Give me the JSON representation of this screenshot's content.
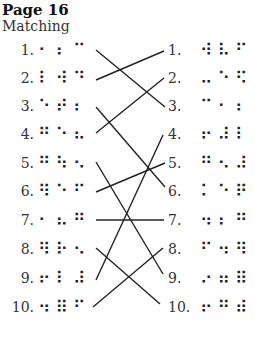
{
  "page": {
    "title": "Page 16",
    "subtitle": "Matching"
  },
  "left_column": [
    {
      "num": "1.",
      "braille": "⠂⠆⠉"
    },
    {
      "num": "2.",
      "braille": "⠇⠺⠙"
    },
    {
      "num": "3.",
      "braille": "⠑⠞⠆"
    },
    {
      "num": "4.",
      "braille": "⠛⠑⠦"
    },
    {
      "num": "5.",
      "braille": "⠛⠳⠢"
    },
    {
      "num": "6.",
      "braille": "⠻⠑⠋"
    },
    {
      "num": "7.",
      "braille": "⠂⠦⠛"
    },
    {
      "num": "8.",
      "braille": "⠻⠗⠢"
    },
    {
      "num": "9.",
      "braille": "⠖⠇⠼"
    },
    {
      "num": "10.",
      "braille": "⠲⠿⠋"
    }
  ],
  "right_column": [
    {
      "num": "1.",
      "braille": "⠺⠧⠋"
    },
    {
      "num": "2.",
      "braille": "⠤⠑⠫"
    },
    {
      "num": "3.",
      "braille": "⠉⠂⠆"
    },
    {
      "num": "4.",
      "braille": "⠖⠼⠇"
    },
    {
      "num": "5.",
      "braille": "⠛⠢⠼"
    },
    {
      "num": "6.",
      "braille": "⠅⠑⠟"
    },
    {
      "num": "7.",
      "braille": "⠲⠆⠛"
    },
    {
      "num": "8.",
      "braille": "⠋⠲⠻"
    },
    {
      "num": "9.",
      "braille": "⠔⠶⠿"
    },
    {
      "num": "10.",
      "braille": "⠖⠛⠾"
    }
  ],
  "matches": [
    {
      "left": 1,
      "right": 3
    },
    {
      "left": 2,
      "right": 1
    },
    {
      "left": 3,
      "right": 6
    },
    {
      "left": 4,
      "right": 2
    },
    {
      "left": 5,
      "right": 9
    },
    {
      "left": 6,
      "right": 5
    },
    {
      "left": 7,
      "right": 7
    },
    {
      "left": 8,
      "right": 10
    },
    {
      "left": 9,
      "right": 4
    },
    {
      "left": 10,
      "right": 8
    }
  ]
}
